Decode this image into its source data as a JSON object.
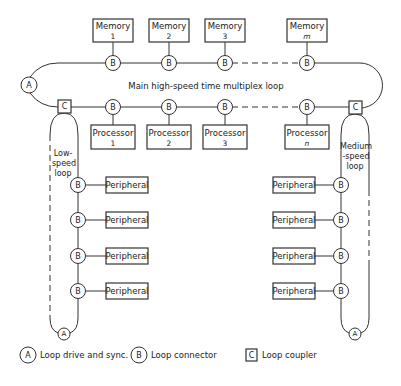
{
  "diagram": {
    "main_loop_label": "Main high-speed time multiplex loop",
    "low_speed_loop_label": [
      "Low-",
      "speed",
      "loop"
    ],
    "medium_speed_loop_label": [
      "Medium",
      "-speed",
      "loop"
    ],
    "memories": [
      {
        "title": "Memory",
        "index": "1",
        "italic": false
      },
      {
        "title": "Memory",
        "index": "2",
        "italic": false
      },
      {
        "title": "Memory",
        "index": "3",
        "italic": false
      },
      {
        "title": "Memory",
        "index": "m",
        "italic": true
      }
    ],
    "processors": [
      {
        "title": "Processor",
        "index": "1",
        "italic": false
      },
      {
        "title": "Processor",
        "index": "2",
        "italic": false
      },
      {
        "title": "Processor",
        "index": "3",
        "italic": false
      },
      {
        "title": "Processor",
        "index": "n",
        "italic": true
      }
    ],
    "node_letters": {
      "drive": "A",
      "connector": "B",
      "coupler": "C"
    },
    "low_speed_peripherals": [
      "Peripheral",
      "Peripheral",
      "Peripheral",
      "Peripheral"
    ],
    "medium_speed_peripherals": [
      "Peripheral",
      "Peripheral",
      "Peripheral",
      "Peripheral"
    ]
  },
  "legend": [
    {
      "symbol": "A",
      "shape": "circle",
      "label": "Loop drive and sync."
    },
    {
      "symbol": "B",
      "shape": "circle",
      "label": "Loop connector"
    },
    {
      "symbol": "C",
      "shape": "square",
      "label": "Loop coupler"
    }
  ]
}
